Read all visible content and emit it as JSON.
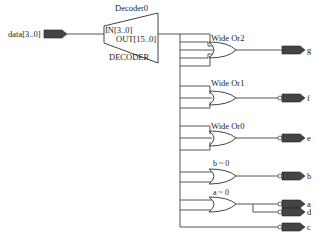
{
  "diagram": {
    "type": "RTL schematic",
    "input_pin": {
      "label": "data[3..0]"
    },
    "decoder": {
      "instance": "Decoder0",
      "type_label": "DECODER",
      "in_port": "IN[3..0]",
      "out_port": "OUT[15..0]"
    },
    "gates": [
      {
        "name": "Wide Or2",
        "output": "g"
      },
      {
        "name": "Wide Or1",
        "output": "f"
      },
      {
        "name": "Wide Or0",
        "output": "e"
      },
      {
        "name": "b~0",
        "output": "b"
      },
      {
        "name": "a~0",
        "output": "a"
      }
    ],
    "output_pins": [
      "g",
      "f",
      "e",
      "b",
      "a",
      "d",
      "c"
    ],
    "colors": {
      "pin_fill": "#444444",
      "wire": "#555555",
      "background": "#ffffff"
    }
  }
}
